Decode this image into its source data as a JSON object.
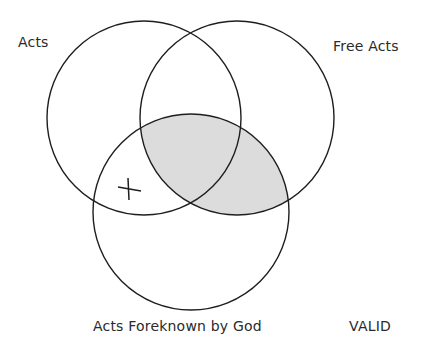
{
  "diagram": {
    "type": "venn-3",
    "labels": {
      "acts": "Acts",
      "free_acts": "Free Acts",
      "foreknown": "Acts Foreknown by God",
      "verdict": "VALID"
    },
    "marks": {
      "x_mark": "X"
    },
    "circles": [
      {
        "name": "Acts",
        "cx": 144,
        "cy": 118,
        "r": 97
      },
      {
        "name": "Free Acts",
        "cx": 237,
        "cy": 118,
        "r": 97
      },
      {
        "name": "Acts Foreknown by God",
        "cx": 191,
        "cy": 212,
        "r": 98
      }
    ],
    "shaded_region": "Free Acts ∩ Acts Foreknown by God",
    "x_region": "Acts ∩ Acts Foreknown by God, outside Free Acts",
    "colors": {
      "stroke": "#1e1e1e",
      "shade": "#dcdcdc",
      "background": "#ffffff"
    }
  }
}
